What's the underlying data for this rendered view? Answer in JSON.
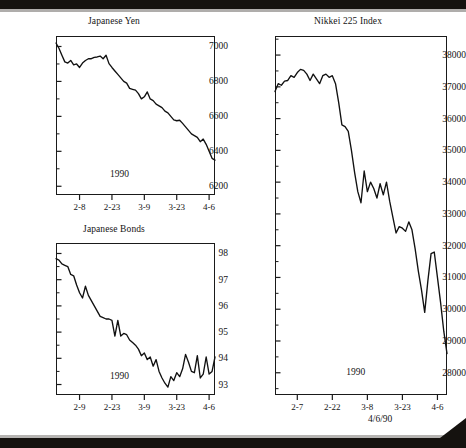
{
  "page": {
    "footer_date": "4/6/90"
  },
  "charts": [
    {
      "id": "japanese-yen",
      "title": "Japanese Yen",
      "year_label": "1990",
      "ylabels": [
        "7000",
        "6800",
        "6600",
        "6400",
        "6200"
      ],
      "xlabels": [
        "2-8",
        "2-23",
        "3-9",
        "3-23",
        "4-6"
      ]
    },
    {
      "id": "japanese-bonds",
      "title": "Japanese Bonds",
      "year_label": "1990",
      "ylabels": [
        "98",
        "97",
        "96",
        "95",
        "94",
        "93"
      ],
      "xlabels": [
        "2-9",
        "2-23",
        "3-9",
        "3-23",
        "4-6"
      ]
    },
    {
      "id": "nikkei-225-index",
      "title": "Nikkei 225 Index",
      "year_label": "1990",
      "ylabels": [
        "38000",
        "37000",
        "36000",
        "35000",
        "34000",
        "33000",
        "32000",
        "31000",
        "30000",
        "29000",
        "28000"
      ],
      "xlabels": [
        "2-7",
        "2-22",
        "3-8",
        "3-23",
        "4-6"
      ]
    }
  ],
  "chart_data": [
    {
      "type": "line",
      "title": "Japanese Yen",
      "xlabel": "1990",
      "ylabel": "",
      "grid": false,
      "legend": false,
      "ylim": [
        6150,
        7060
      ],
      "ytick_values": [
        7000,
        6800,
        6600,
        6400,
        6200
      ],
      "xtick_labels": [
        "2-8",
        "2-23",
        "3-9",
        "3-23",
        "4-6"
      ],
      "xtick_positions": [
        8,
        19,
        30,
        41,
        52
      ],
      "x": [
        0,
        1,
        2,
        3,
        4,
        5,
        6,
        7,
        8,
        9,
        10,
        11,
        12,
        13,
        14,
        15,
        16,
        17,
        18,
        19,
        20,
        21,
        22,
        23,
        24,
        25,
        26,
        27,
        28,
        29,
        30,
        31,
        32,
        33,
        34,
        35,
        36,
        37,
        38,
        39,
        40,
        41,
        42,
        43,
        44,
        45,
        46,
        47,
        48,
        49,
        50,
        51,
        52,
        53,
        54
      ],
      "values": [
        7020,
        6990,
        6950,
        6912,
        6905,
        6920,
        6895,
        6900,
        6880,
        6905,
        6920,
        6930,
        6930,
        6938,
        6940,
        6945,
        6930,
        6950,
        6902,
        6880,
        6860,
        6840,
        6820,
        6800,
        6790,
        6760,
        6755,
        6750,
        6730,
        6700,
        6712,
        6740,
        6700,
        6690,
        6670,
        6660,
        6650,
        6630,
        6620,
        6600,
        6580,
        6575,
        6578,
        6560,
        6540,
        6520,
        6500,
        6490,
        6480,
        6455,
        6470,
        6440,
        6400,
        6360,
        6350
      ],
      "description": "Japanese Yen futures declined steadily from about 7020 in early February 1990 to roughly 6350 by 4-6."
    },
    {
      "type": "line",
      "title": "Japanese Bonds",
      "xlabel": "1990",
      "ylabel": "",
      "grid": false,
      "legend": false,
      "ylim": [
        92.6,
        98.4
      ],
      "ytick_values": [
        98,
        97,
        96,
        95,
        94,
        93
      ],
      "xtick_labels": [
        "2-9",
        "2-23",
        "3-9",
        "3-23",
        "4-6"
      ],
      "xtick_positions": [
        8,
        19,
        30,
        41,
        52
      ],
      "x": [
        0,
        1,
        2,
        3,
        4,
        5,
        6,
        7,
        8,
        9,
        10,
        11,
        12,
        13,
        14,
        15,
        16,
        17,
        18,
        19,
        20,
        21,
        22,
        23,
        24,
        25,
        26,
        27,
        28,
        29,
        30,
        31,
        32,
        33,
        34,
        35,
        36,
        37,
        38,
        39,
        40,
        41,
        42,
        43,
        44,
        45,
        46,
        47,
        48,
        49,
        50,
        51,
        52,
        53,
        54
      ],
      "values": [
        97.8,
        97.75,
        97.6,
        97.55,
        97.5,
        97.2,
        97.15,
        96.8,
        96.5,
        96.3,
        96.75,
        96.4,
        96.2,
        96.0,
        95.8,
        95.6,
        95.55,
        95.5,
        95.5,
        95.45,
        94.85,
        95.45,
        94.85,
        94.95,
        94.9,
        94.7,
        94.6,
        94.5,
        94.35,
        94.1,
        94.2,
        93.95,
        94.05,
        93.7,
        93.95,
        93.5,
        93.25,
        93.05,
        92.9,
        93.3,
        93.15,
        93.45,
        93.3,
        93.6,
        94.15,
        93.85,
        93.5,
        93.45,
        94.1,
        93.25,
        93.4,
        94.05,
        93.4,
        93.5,
        94.05
      ],
      "description": "Japanese Bond prices fell from about 97.8 to a low near 92.9 in late March 1990, then recovered in a volatile range around 93.3-94.1."
    },
    {
      "type": "line",
      "title": "Nikkei 225 Index",
      "xlabel": "1990",
      "ylabel": "",
      "grid": false,
      "legend": false,
      "ylim": [
        27300,
        38600
      ],
      "ytick_values": [
        38000,
        37000,
        36000,
        35000,
        34000,
        33000,
        32000,
        31000,
        30000,
        29000,
        28000
      ],
      "xtick_labels": [
        "2-7",
        "2-22",
        "3-8",
        "3-23",
        "4-6"
      ],
      "xtick_positions": [
        7,
        18,
        29,
        40,
        51
      ],
      "x": [
        0,
        1,
        2,
        3,
        4,
        5,
        6,
        7,
        8,
        9,
        10,
        11,
        12,
        13,
        14,
        15,
        16,
        17,
        18,
        19,
        20,
        21,
        22,
        23,
        24,
        25,
        26,
        27,
        28,
        29,
        30,
        31,
        32,
        33,
        34,
        35,
        36,
        37,
        38,
        39,
        40,
        41,
        42,
        43,
        44,
        45,
        46,
        47,
        48,
        49,
        50,
        51,
        52,
        53,
        54
      ],
      "values": [
        36850,
        37100,
        37050,
        37180,
        37200,
        37350,
        37300,
        37450,
        37550,
        37520,
        37400,
        37200,
        37400,
        37250,
        37100,
        37350,
        37400,
        37300,
        37350,
        37100,
        36500,
        35800,
        35750,
        35600,
        35000,
        34300,
        33700,
        33350,
        34350,
        33700,
        34000,
        33800,
        33500,
        33950,
        33600,
        34000,
        33400,
        32900,
        32400,
        32600,
        32550,
        32450,
        32750,
        32500,
        31900,
        31200,
        30600,
        29900,
        30900,
        31750,
        31800,
        31000,
        30200,
        29300,
        28600,
        28100,
        28700,
        28300,
        29300
      ],
      "description": "The Nikkei 225 peaked near 37550 in mid-February 1990 then fell sharply to about 28100 in early April, closing near 29300 on 4/6/90."
    }
  ]
}
